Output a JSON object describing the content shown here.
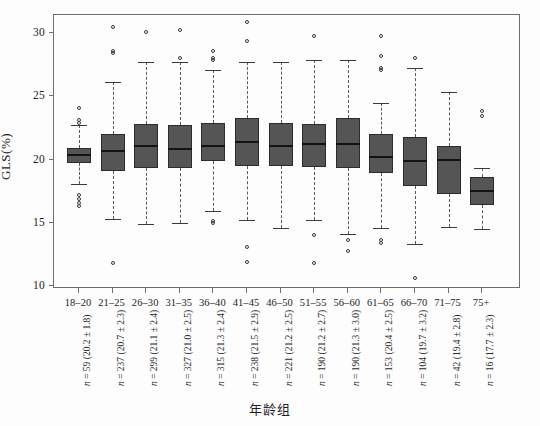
{
  "chart_data": {
    "type": "box",
    "title": "",
    "xlabel": "年龄组",
    "ylabel": "GLS(%)",
    "ylim": [
      10,
      31.5
    ],
    "yticks": [
      10,
      15,
      20,
      25,
      30
    ],
    "ytick_labels": [
      "10",
      "15",
      "20",
      "25",
      "30"
    ],
    "grid": false,
    "legend": "none",
    "categories": [
      "18–20",
      "21–25",
      "26–30",
      "31–35",
      "36–40",
      "41–45",
      "46–50",
      "51–55",
      "56–60",
      "61–65",
      "66–70",
      "71–75",
      "75+"
    ],
    "annotations": [
      "n = 59 (20.2 ± 1.8)",
      "n = 237 (20.7 ± 2.3)",
      "n = 299 (21.1 ± 2.4)",
      "n = 327 (21.0 ± 2.5)",
      "n = 315 (21.3 ± 2.4)",
      "n = 238 (21.5 ± 2.9)",
      "n = 221 (21.2 ± 2.5)",
      "n = 190 (21.2 ± 2.7)",
      "n = 190 (21.3 ± 3.0)",
      "n = 153 (20.4 ± 2.5)",
      "n = 104 (19.7 ± 3.2)",
      "n = 42 (19.4 ± 2.8)",
      "n = 16 (17.7 ± 2.3)"
    ],
    "boxes": [
      {
        "category": "18–20",
        "n": 59,
        "mean": 20.2,
        "sd": 1.8,
        "whisker_low": 18.1,
        "q1": 19.7,
        "median": 20.35,
        "q3": 20.9,
        "whisker_high": 22.7,
        "outliers": [
          24.1,
          23.1,
          22.9,
          17.2,
          16.9,
          16.6,
          16.3
        ]
      },
      {
        "category": "21–25",
        "n": 237,
        "mean": 20.7,
        "sd": 2.3,
        "whisker_low": 15.3,
        "q1": 19.1,
        "median": 20.65,
        "q3": 22.0,
        "whisker_high": 26.1,
        "outliers": [
          30.5,
          28.6,
          28.4,
          11.8
        ]
      },
      {
        "category": "26–30",
        "n": 299,
        "mean": 21.1,
        "sd": 2.4,
        "whisker_low": 14.9,
        "q1": 19.3,
        "median": 21.05,
        "q3": 22.8,
        "whisker_high": 27.7,
        "outliers": [
          30.1
        ]
      },
      {
        "category": "31–35",
        "n": 327,
        "mean": 21.0,
        "sd": 2.5,
        "whisker_low": 15.0,
        "q1": 19.3,
        "median": 20.8,
        "q3": 22.7,
        "whisker_high": 27.7,
        "outliers": [
          30.2,
          28.0
        ]
      },
      {
        "category": "36–40",
        "n": 315,
        "mean": 21.3,
        "sd": 2.4,
        "whisker_low": 15.9,
        "q1": 19.9,
        "median": 21.05,
        "q3": 22.9,
        "whisker_high": 27.1,
        "outliers": [
          28.6,
          28.0,
          27.9,
          15.1,
          15.0
        ]
      },
      {
        "category": "41–45",
        "n": 238,
        "mean": 21.5,
        "sd": 2.9,
        "whisker_low": 15.2,
        "q1": 19.5,
        "median": 21.4,
        "q3": 23.3,
        "whisker_high": 27.7,
        "outliers": [
          30.9,
          29.4,
          13.1,
          11.9
        ]
      },
      {
        "category": "46–50",
        "n": 221,
        "mean": 21.2,
        "sd": 2.5,
        "whisker_low": 14.6,
        "q1": 19.5,
        "median": 21.05,
        "q3": 22.9,
        "whisker_high": 27.7,
        "outliers": []
      },
      {
        "category": "51–55",
        "n": 190,
        "mean": 21.2,
        "sd": 2.7,
        "whisker_low": 15.2,
        "q1": 19.4,
        "median": 21.2,
        "q3": 22.8,
        "whisker_high": 27.9,
        "outliers": [
          29.8,
          14.0,
          11.8
        ]
      },
      {
        "category": "56–60",
        "n": 190,
        "mean": 21.3,
        "sd": 3.0,
        "whisker_low": 14.1,
        "q1": 19.3,
        "median": 21.2,
        "q3": 23.3,
        "whisker_high": 27.9,
        "outliers": [
          12.8,
          13.6
        ]
      },
      {
        "category": "61–65",
        "n": 153,
        "mean": 20.4,
        "sd": 2.5,
        "whisker_low": 14.6,
        "q1": 18.9,
        "median": 20.2,
        "q3": 22.0,
        "whisker_high": 24.5,
        "outliers": [
          29.8,
          28.2,
          27.2,
          27.1,
          13.6,
          13.4
        ]
      },
      {
        "category": "66–70",
        "n": 104,
        "mean": 19.7,
        "sd": 3.2,
        "whisker_low": 13.3,
        "q1": 17.9,
        "median": 19.85,
        "q3": 21.8,
        "whisker_high": 27.2,
        "outliers": [
          28.0,
          10.6
        ]
      },
      {
        "category": "71–75",
        "n": 42,
        "mean": 19.4,
        "sd": 2.8,
        "whisker_low": 14.7,
        "q1": 17.3,
        "median": 20.0,
        "q3": 21.1,
        "whisker_high": 25.3,
        "outliers": []
      },
      {
        "category": "75+",
        "n": 16,
        "mean": 17.7,
        "sd": 2.3,
        "whisker_low": 14.5,
        "q1": 16.4,
        "median": 17.5,
        "q3": 18.6,
        "whisker_high": 19.3,
        "outliers": [
          23.8,
          23.4
        ]
      }
    ],
    "style": {
      "box_fill": "#555555",
      "box_border": "#2b2b2b",
      "median_color": "#121212",
      "whisker_color": "#5b5b5b",
      "outlier_color": "#3a3a3a",
      "frame_color": "#6e6e6e",
      "background": "#fdfdfd"
    }
  }
}
